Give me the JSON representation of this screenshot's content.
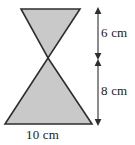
{
  "figure": {
    "shape_name": "hourglass-triangles",
    "fill_color": "#c9c9c9",
    "stroke_color": "#2e2e2e",
    "background_color": "#ffffff"
  },
  "shapes": {
    "upper_triangle": {
      "name": "upper-inverted-triangle",
      "points": "21,9 80,9 48,58",
      "description": "Inverted triangle, apex pointing down"
    },
    "lower_triangle": {
      "name": "lower-triangle",
      "points": "48,58 92,124 5,124",
      "description": "Upright triangle, apex pointing up"
    }
  },
  "dimensions": {
    "vertical_upper": {
      "value": "6 cm",
      "number": 6,
      "unit": "cm",
      "measures": "height of upper triangle"
    },
    "vertical_lower": {
      "value": "8 cm",
      "number": 8,
      "unit": "cm",
      "measures": "height of lower triangle"
    },
    "horizontal_base": {
      "value": "10 cm",
      "number": 10,
      "unit": "cm",
      "measures": "base of lower triangle"
    }
  },
  "chart_data": {
    "type": "diagram",
    "labels": [
      "6 cm",
      "8 cm",
      "10 cm"
    ],
    "values": [
      6,
      8,
      10
    ],
    "units": "cm",
    "annotations": [
      "6 cm = height of top inverted triangle",
      "8 cm = height of bottom triangle",
      "10 cm = base width of bottom triangle"
    ]
  }
}
